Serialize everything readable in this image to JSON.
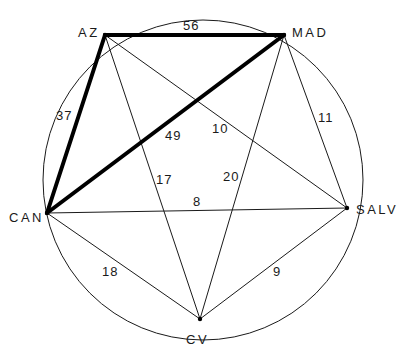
{
  "diagram": {
    "type": "complete graph inscribed in circle",
    "nodes": [
      {
        "id": "AZ",
        "label": "AZ"
      },
      {
        "id": "MAD",
        "label": "MAD"
      },
      {
        "id": "SALV",
        "label": "SALV"
      },
      {
        "id": "CV",
        "label": "CV"
      },
      {
        "id": "CAN",
        "label": "CAN"
      }
    ],
    "edges": [
      {
        "from": "AZ",
        "to": "MAD",
        "weight": "56",
        "highlighted": true
      },
      {
        "from": "AZ",
        "to": "CAN",
        "weight": "37",
        "highlighted": true
      },
      {
        "from": "CAN",
        "to": "MAD",
        "weight": "49",
        "highlighted": true
      },
      {
        "from": "AZ",
        "to": "SALV",
        "weight": "10",
        "highlighted": false
      },
      {
        "from": "AZ",
        "to": "CV",
        "weight": "17",
        "highlighted": false
      },
      {
        "from": "MAD",
        "to": "CV",
        "weight": "20",
        "highlighted": false
      },
      {
        "from": "MAD",
        "to": "SALV",
        "weight": "11",
        "highlighted": false
      },
      {
        "from": "CAN",
        "to": "SALV",
        "weight": "8",
        "highlighted": false
      },
      {
        "from": "CAN",
        "to": "CV",
        "weight": "18",
        "highlighted": false
      },
      {
        "from": "CV",
        "to": "SALV",
        "weight": "9",
        "highlighted": false
      }
    ]
  }
}
